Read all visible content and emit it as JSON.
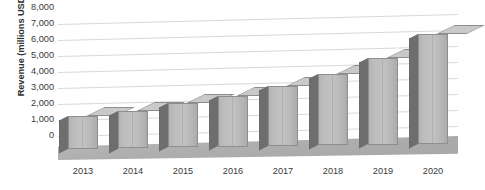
{
  "chart_data": {
    "type": "bar",
    "title": "",
    "subtitle": "",
    "xlabel": "",
    "ylabel": "Revenue (millions USD)",
    "categories": [
      "2013",
      "2014",
      "2015",
      "2016",
      "2017",
      "2018",
      "2019",
      "2020"
    ],
    "values": [
      2050,
      2350,
      2750,
      3150,
      3750,
      4450,
      5400,
      6850
    ],
    "series": [
      {
        "name": "Revenue",
        "values": [
          2050,
          2350,
          2750,
          3150,
          3750,
          4450,
          5400,
          6850
        ]
      }
    ],
    "ylim": [
      0,
      8000
    ],
    "ytick_step": 1000,
    "ytick_labels": [
      "0",
      "1,000",
      "2,000",
      "3,000",
      "4,000",
      "5,000",
      "6,000",
      "7,000",
      "8,000"
    ],
    "ytick_values": [
      0,
      1000,
      2000,
      3000,
      4000,
      5000,
      6000,
      7000,
      8000
    ],
    "grid": true,
    "grid_axis": "y",
    "legend": false,
    "legend_position": "none",
    "style": "3d-column",
    "colors": {
      "bar_front": "#bdbdbd",
      "bar_side": "#6e6e6e",
      "bar_top": "#c9c9c9",
      "bar_outline": "#8e8e8e",
      "gridline": "#d8d8d8",
      "axis_line": "#6f6f6f",
      "floor": "#b0b0b0",
      "text": "#3a3a3a",
      "background": "#ffffff"
    }
  }
}
